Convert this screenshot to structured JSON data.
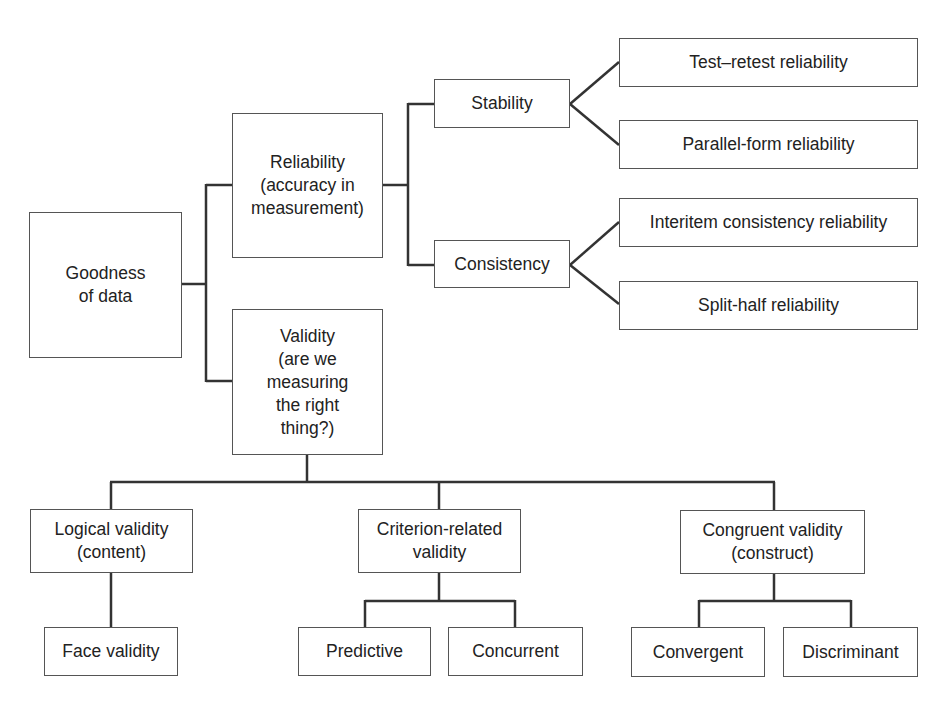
{
  "diagram": {
    "root": {
      "label": "Goodness\nof data"
    },
    "reliability": {
      "label": "Reliability\n(accuracy in\nmeasurement)",
      "stability": {
        "label": "Stability",
        "children": [
          "Test–retest reliability",
          "Parallel-form reliability"
        ]
      },
      "consistency": {
        "label": "Consistency",
        "children": [
          "Interitem consistency reliability",
          "Split-half reliability"
        ]
      }
    },
    "validity": {
      "label": "Validity\n(are we\nmeasuring\nthe right\nthing?)",
      "logical": {
        "label": "Logical validity\n(content)",
        "children": [
          "Face validity"
        ]
      },
      "criterion": {
        "label": "Criterion-related\nvalidity",
        "children": [
          "Predictive",
          "Concurrent"
        ]
      },
      "congruent": {
        "label": "Congruent validity\n(construct)",
        "children": [
          "Convergent",
          "Discriminant"
        ]
      }
    }
  },
  "colors": {
    "line": "#333333",
    "border": "#555555",
    "text": "#222222",
    "background": "#ffffff"
  }
}
